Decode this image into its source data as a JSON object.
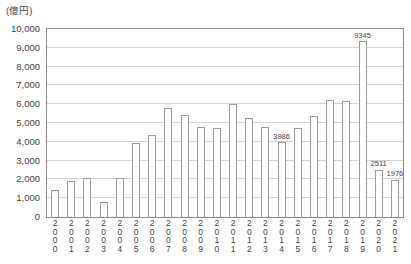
{
  "chart_data": {
    "type": "bar",
    "title": "",
    "subtitle": "",
    "unit_caption": "(億円)",
    "xlabel": "",
    "ylabel": "",
    "ylim": [
      0,
      10000
    ],
    "ytick_step": 1000,
    "grid": true,
    "legend": false,
    "categories": [
      "2000",
      "2001",
      "2002",
      "2003",
      "2004",
      "2005",
      "2006",
      "2007",
      "2008",
      "2009",
      "2010",
      "2011",
      "2012",
      "2013",
      "2014",
      "2015",
      "2016",
      "2017",
      "2018",
      "2019",
      "2020",
      "2021"
    ],
    "values": [
      1430,
      1930,
      2080,
      820,
      2090,
      3960,
      4340,
      5800,
      5400,
      4780,
      4760,
      6000,
      5280,
      4800,
      3986,
      4760,
      5350,
      6200,
      6150,
      7100,
      8400,
      9345
    ],
    "ytick_labels": [
      "0",
      "1,000",
      "2,000",
      "3,000",
      "4,000",
      "5,000",
      "6,000",
      "7,000",
      "8,000",
      "9,000",
      "10,000"
    ],
    "ytick_values": [
      0,
      1000,
      2000,
      3000,
      4000,
      5000,
      6000,
      7000,
      8000,
      9000,
      10000
    ],
    "data_labels": [
      {
        "category": "2014",
        "value": 3986,
        "text": "3986"
      },
      {
        "category": "2019",
        "value": 9345,
        "text": "9345"
      },
      {
        "category": "2020",
        "value": 2511,
        "text": "2511"
      },
      {
        "category": "2021",
        "value": 1976,
        "text": "1976"
      }
    ],
    "bar_color": "#ffffff",
    "bar_border_color": "#9a9a9a",
    "grid_color": "#d2d2d2",
    "axis_color": "#8a8a8a",
    "text_color": "#3f3f3f"
  }
}
